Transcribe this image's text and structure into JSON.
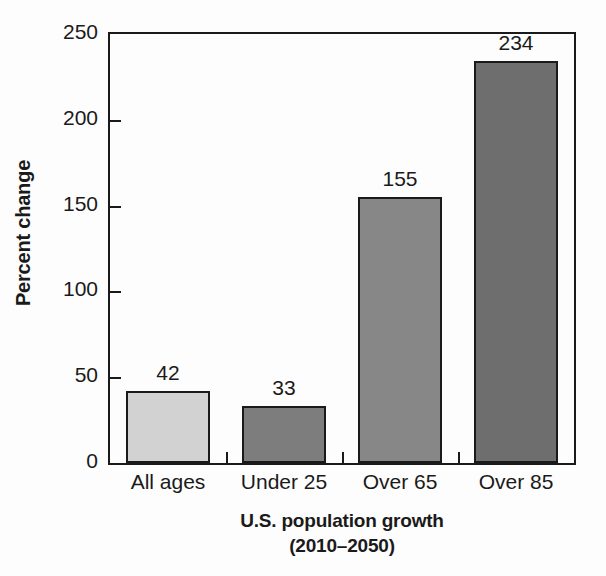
{
  "chart_data": {
    "type": "bar",
    "title": "",
    "categories": [
      "All ages",
      "Under 25",
      "Over 65",
      "Over 85"
    ],
    "values": [
      42,
      33,
      155,
      234
    ],
    "value_labels": [
      "42",
      "33",
      "155",
      "234"
    ],
    "bar_colors": [
      "#d2d2d2",
      "#7d7d7d",
      "#878787",
      "#6e6e6e"
    ],
    "bar_edge_color": "#1a1a1a",
    "xlabel": "U.S. population growth",
    "xlabel_line2": "(2010–2050)",
    "ylabel": "Percent change",
    "ylim": [
      0,
      250
    ],
    "yticks": [
      0,
      50,
      100,
      150,
      200,
      250
    ],
    "ytick_labels": [
      "0",
      "50",
      "100",
      "150",
      "200",
      "250"
    ],
    "grid": false,
    "legend": null,
    "frame": true,
    "background_color": "#fdfdfd"
  }
}
